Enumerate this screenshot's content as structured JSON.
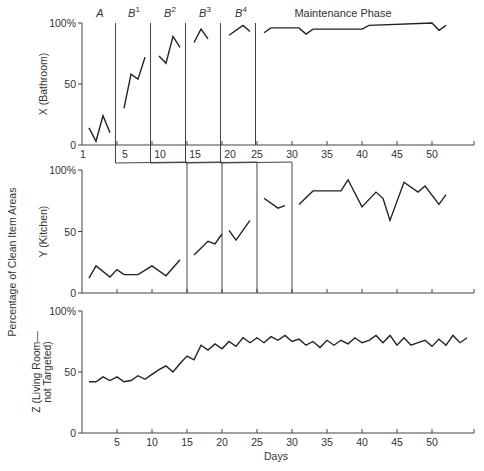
{
  "chart_data": {
    "type": "line",
    "title": "",
    "ylabel_shared": "Percentage of Clean Item Areas",
    "xlabel": "Days",
    "x_ticks": [
      5,
      10,
      15,
      20,
      25,
      30,
      35,
      40,
      45,
      50
    ],
    "x_first_label": "1",
    "y_ticks": [
      "0",
      "50",
      "100%"
    ],
    "ylim": [
      0,
      100
    ],
    "phases": [
      {
        "label": "A",
        "sup": ""
      },
      {
        "label": "B",
        "sup": "1"
      },
      {
        "label": "B",
        "sup": "2"
      },
      {
        "label": "B",
        "sup": "3"
      },
      {
        "label": "B",
        "sup": "4"
      },
      {
        "label": "Maintenance Phase",
        "sup": ""
      }
    ],
    "panels": [
      {
        "name": "X (Bathroom)",
        "phase_changes_after_day": [
          5,
          10,
          15,
          20,
          25
        ],
        "segments": [
          {
            "phase": "A",
            "x": [
              1,
              2,
              3,
              4
            ],
            "y": [
              14,
              3,
              24,
              10
            ]
          },
          {
            "phase": "B1",
            "x": [
              6,
              7,
              8,
              9
            ],
            "y": [
              30,
              58,
              54,
              72
            ]
          },
          {
            "phase": "B2",
            "x": [
              11,
              12,
              13,
              14
            ],
            "y": [
              73,
              67,
              89,
              80
            ]
          },
          {
            "phase": "B3",
            "x": [
              16,
              17,
              18
            ],
            "y": [
              84,
              95,
              87
            ]
          },
          {
            "phase": "B4",
            "x": [
              21,
              23,
              24
            ],
            "y": [
              90,
              98,
              93
            ]
          },
          {
            "phase": "Maintenance",
            "x": [
              26,
              27,
              31,
              32,
              33,
              40,
              41,
              50,
              51,
              52
            ],
            "y": [
              92,
              96,
              96,
              91,
              95,
              95,
              98,
              100,
              94,
              98
            ]
          }
        ]
      },
      {
        "name": "Y (Kitchen)",
        "phase_changes_after_day": [
          15,
          20,
          25,
          30
        ],
        "segments": [
          {
            "phase": "A",
            "x": [
              1,
              2,
              4,
              5,
              6,
              8,
              10,
              12,
              14
            ],
            "y": [
              12,
              22,
              13,
              19,
              15,
              15,
              22,
              14,
              27
            ]
          },
          {
            "phase": "B1",
            "x": [
              16,
              18,
              19,
              20
            ],
            "y": [
              31,
              42,
              40,
              48
            ]
          },
          {
            "phase": "B2",
            "x": [
              21,
              22,
              24
            ],
            "y": [
              51,
              43,
              59
            ]
          },
          {
            "phase": "B3",
            "x": [
              26,
              28,
              29
            ],
            "y": [
              77,
              69,
              71
            ]
          },
          {
            "phase": "Maintenance",
            "x": [
              31,
              33,
              37,
              38,
              40,
              42,
              43,
              44,
              46,
              48,
              49,
              51,
              52
            ],
            "y": [
              72,
              83,
              83,
              92,
              70,
              82,
              77,
              59,
              90,
              82,
              87,
              72,
              80
            ]
          }
        ]
      },
      {
        "name": "Z (Living Room—not Targeted)",
        "name_line1": "Z (Living Room—",
        "name_line2": "not Targeted)",
        "phase_changes_after_day": [],
        "segments": [
          {
            "phase": "all",
            "x": [
              1,
              2,
              3,
              4,
              5,
              6,
              7,
              8,
              9,
              10,
              11,
              12,
              13,
              14,
              15,
              16,
              17,
              18,
              19,
              20,
              21,
              22,
              23,
              24,
              25,
              26,
              27,
              28,
              29,
              30,
              31,
              32,
              33,
              34,
              35,
              36,
              37,
              38,
              39,
              40,
              41,
              42,
              43,
              44,
              45,
              46,
              47,
              48,
              49,
              50,
              51,
              52,
              53,
              54,
              55
            ],
            "y": [
              42,
              42,
              46,
              43,
              46,
              42,
              43,
              47,
              44,
              48,
              52,
              55,
              50,
              57,
              63,
              60,
              72,
              68,
              73,
              69,
              75,
              71,
              78,
              74,
              78,
              74,
              79,
              76,
              80,
              75,
              77,
              72,
              75,
              70,
              76,
              72,
              76,
              73,
              78,
              74,
              76,
              80,
              74,
              80,
              72,
              78,
              72,
              74,
              76,
              71,
              77,
              72,
              80,
              74,
              78
            ]
          }
        ]
      }
    ]
  }
}
